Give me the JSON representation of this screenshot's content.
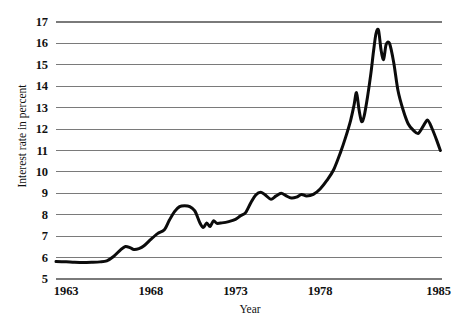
{
  "chart_data": {
    "type": "line",
    "title": "",
    "xlabel": "Year",
    "ylabel": "Interest rate in percent",
    "xlim": [
      1962.4,
      1985.2
    ],
    "ylim": [
      5,
      17
    ],
    "grid": "horizontal",
    "legend": "none",
    "y_ticks": [
      17,
      16,
      15,
      14,
      13,
      12,
      11,
      10,
      9,
      8,
      7,
      6,
      5
    ],
    "y_tick_labels": [
      "17",
      "16",
      "15",
      "14",
      "13",
      "12",
      "11",
      "10",
      "9",
      "8",
      "7",
      "6",
      "5"
    ],
    "x_ticks": [
      1963,
      1968,
      1973,
      1978,
      1985
    ],
    "x_tick_labels": [
      "1963",
      "1968",
      "1973",
      "1978",
      "1985"
    ],
    "series": [
      {
        "name": "Interest rate",
        "color": "#0b0b0b",
        "x": [
          1962.4,
          1963.0,
          1963.5,
          1964.0,
          1964.5,
          1965.0,
          1965.4,
          1965.8,
          1966.2,
          1966.5,
          1966.8,
          1967.0,
          1967.3,
          1967.6,
          1968.0,
          1968.4,
          1968.8,
          1969.1,
          1969.4,
          1969.7,
          1970.0,
          1970.3,
          1970.6,
          1970.9,
          1971.1,
          1971.3,
          1971.5,
          1971.7,
          1971.9,
          1972.2,
          1972.6,
          1973.0,
          1973.3,
          1973.6,
          1973.9,
          1974.2,
          1974.5,
          1974.8,
          1975.1,
          1975.4,
          1975.7,
          1976.0,
          1976.3,
          1976.6,
          1976.9,
          1977.2,
          1977.6,
          1978.0,
          1978.4,
          1978.8,
          1979.2,
          1979.5,
          1979.8,
          1980.0,
          1980.15,
          1980.3,
          1980.45,
          1980.6,
          1980.8,
          1981.0,
          1981.15,
          1981.3,
          1981.45,
          1981.6,
          1981.75,
          1981.9,
          1982.1,
          1982.35,
          1982.6,
          1982.9,
          1983.2,
          1983.5,
          1983.8,
          1984.1,
          1984.35,
          1984.6,
          1984.9,
          1985.1
        ],
        "y": [
          5.82,
          5.8,
          5.78,
          5.77,
          5.78,
          5.8,
          5.85,
          6.05,
          6.35,
          6.52,
          6.45,
          6.38,
          6.42,
          6.55,
          6.85,
          7.12,
          7.3,
          7.75,
          8.15,
          8.38,
          8.42,
          8.38,
          8.18,
          7.62,
          7.4,
          7.62,
          7.45,
          7.72,
          7.6,
          7.62,
          7.68,
          7.78,
          7.95,
          8.1,
          8.55,
          8.92,
          9.05,
          8.9,
          8.72,
          8.88,
          9.0,
          8.88,
          8.78,
          8.82,
          8.95,
          8.88,
          8.95,
          9.2,
          9.6,
          10.1,
          10.9,
          11.6,
          12.4,
          13.1,
          13.7,
          12.9,
          12.35,
          12.6,
          13.5,
          14.6,
          15.6,
          16.45,
          16.62,
          15.7,
          15.25,
          15.95,
          16.0,
          15.1,
          13.8,
          12.9,
          12.25,
          11.95,
          11.8,
          12.15,
          12.42,
          12.05,
          11.45,
          11.0
        ],
        "annotations": [
          {
            "label": "plateau near 5.8",
            "x": 1963.5,
            "y": 5.78
          },
          {
            "label": "local peak",
            "x": 1966.5,
            "y": 6.52
          },
          {
            "label": "peak",
            "x": 1970.0,
            "y": 8.42
          },
          {
            "label": "dip",
            "x": 1971.1,
            "y": 7.4
          },
          {
            "label": "plateau near 9",
            "x": 1974.5,
            "y": 9.05
          },
          {
            "label": "first spike",
            "x": 1980.15,
            "y": 13.7
          },
          {
            "label": "trough",
            "x": 1980.45,
            "y": 12.35
          },
          {
            "label": "maximum",
            "x": 1981.15,
            "y": 16.62
          },
          {
            "label": "notch",
            "x": 1981.6,
            "y": 15.25
          },
          {
            "label": "second peak",
            "x": 1981.9,
            "y": 16.0
          },
          {
            "label": "trough",
            "x": 1983.8,
            "y": 11.8
          },
          {
            "label": "bump",
            "x": 1984.35,
            "y": 12.42
          },
          {
            "label": "end",
            "x": 1985.1,
            "y": 11.0
          }
        ]
      }
    ]
  }
}
